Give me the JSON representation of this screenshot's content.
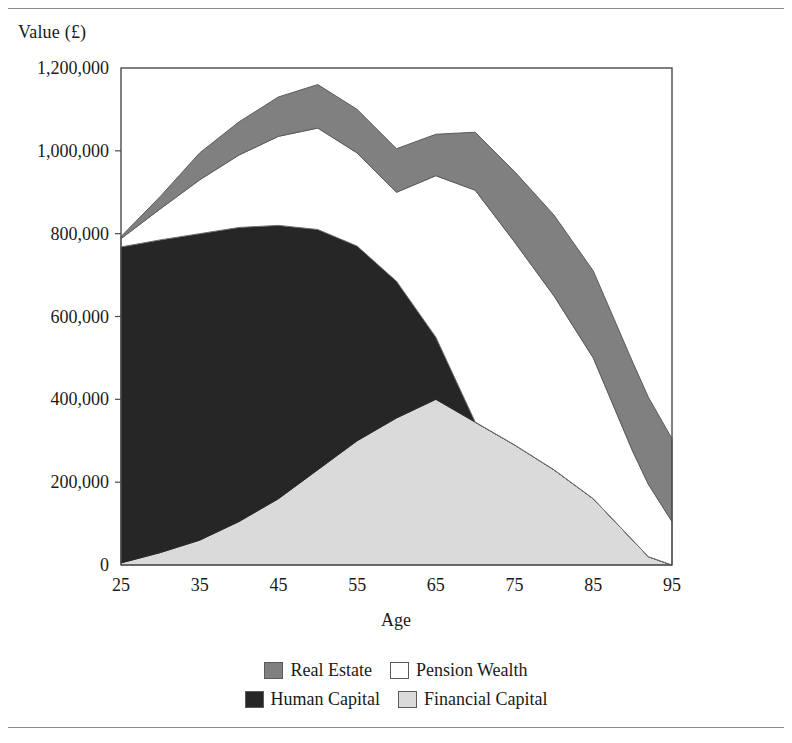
{
  "figure": {
    "y_axis_title": "Value (£)",
    "x_axis_title": "Age"
  },
  "legend": {
    "rows": [
      [
        {
          "key": "real_estate",
          "label": "Real Estate",
          "color": "#808080",
          "swatch": "legend-swatch-real-estate"
        },
        {
          "key": "pension_wealth",
          "label": "Pension Wealth",
          "color": "#ffffff",
          "swatch": "legend-swatch-pension-wealth"
        }
      ],
      [
        {
          "key": "human_capital",
          "label": "Human Capital",
          "color": "#262626",
          "swatch": "legend-swatch-human-capital"
        },
        {
          "key": "financial_capital",
          "label": "Financial Capital",
          "color": "#dadada",
          "swatch": "legend-swatch-financial-capital"
        }
      ]
    ]
  },
  "chart_data": {
    "type": "area",
    "stacked": true,
    "title": "",
    "xlabel": "Age",
    "ylabel": "Value (£)",
    "xlim": [
      25,
      95
    ],
    "ylim": [
      0,
      1200000
    ],
    "xticks": [
      25,
      35,
      45,
      55,
      65,
      75,
      85,
      95
    ],
    "xtick_labels": [
      "25",
      "35",
      "45",
      "55",
      "65",
      "75",
      "85",
      "95"
    ],
    "yticks": [
      0,
      200000,
      400000,
      600000,
      800000,
      1000000,
      1200000
    ],
    "ytick_labels": [
      "0",
      "200,000",
      "400,000",
      "600,000",
      "800,000",
      "1,000,000",
      "1,200,000"
    ],
    "grid": false,
    "legend_position": "bottom",
    "x": [
      25,
      30,
      35,
      40,
      45,
      50,
      55,
      60,
      65,
      70,
      75,
      80,
      85,
      90,
      92,
      95
    ],
    "series": [
      {
        "name": "Financial Capital",
        "key": "financial_capital",
        "color": "#dadada",
        "stroke": "#6e6e6e",
        "values": [
          5000,
          30000,
          60000,
          105000,
          160000,
          230000,
          300000,
          355000,
          400000,
          345000,
          290000,
          230000,
          160000,
          60000,
          20000,
          0
        ]
      },
      {
        "name": "Human Capital",
        "key": "human_capital",
        "color": "#262626",
        "stroke": "#262626",
        "values": [
          763000,
          755000,
          740000,
          710000,
          660000,
          580000,
          470000,
          330000,
          150000,
          0,
          0,
          0,
          0,
          0,
          0,
          0
        ]
      },
      {
        "name": "Pension Wealth",
        "key": "pension_wealth",
        "color": "#ffffff",
        "stroke": "#6e6e6e",
        "values": [
          20000,
          75000,
          130000,
          175000,
          215000,
          245000,
          225000,
          215000,
          390000,
          560000,
          490000,
          420000,
          340000,
          215000,
          175000,
          105000
        ]
      },
      {
        "name": "Real Estate",
        "key": "real_estate",
        "color": "#808080",
        "stroke": "#5b5b5b",
        "values": [
          5000,
          30000,
          65000,
          80000,
          95000,
          105000,
          105000,
          105000,
          100000,
          140000,
          170000,
          195000,
          210000,
          215000,
          210000,
          200000
        ]
      }
    ]
  },
  "plot_geometry": {
    "left": 121,
    "top": 68,
    "right": 672,
    "bottom": 565,
    "border_color": "#4a4a4a"
  }
}
